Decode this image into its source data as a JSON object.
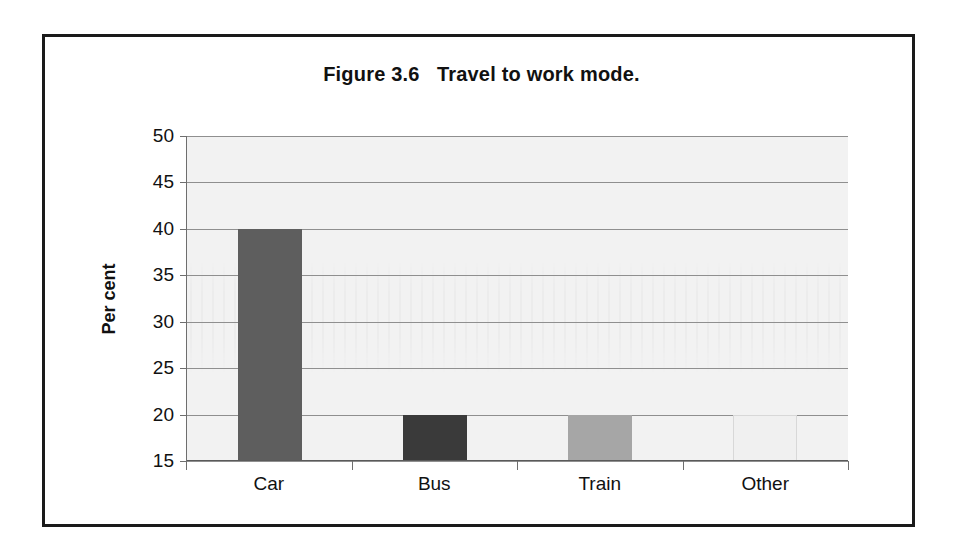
{
  "figure": {
    "title": "Figure 3.6   Travel to work mode."
  },
  "chart_data": {
    "type": "bar",
    "title": "Figure 3.6   Travel to work mode.",
    "xlabel": "",
    "ylabel": "Per cent",
    "categories": [
      "Car",
      "Bus",
      "Train",
      "Other"
    ],
    "values": [
      40,
      20,
      20,
      20
    ],
    "series": [
      {
        "name": "Travel to work mode",
        "values": [
          40,
          20,
          20,
          20
        ]
      }
    ],
    "ylim": [
      15,
      50
    ],
    "ytick_labels": [
      "50",
      "45",
      "40",
      "35",
      "30",
      "25",
      "20",
      "15"
    ],
    "ytick_values": [
      50,
      45,
      40,
      35,
      30,
      25,
      20,
      15
    ],
    "ytick_step": 5,
    "grid": true,
    "grid_axis": "y",
    "legend": false,
    "legend_position": "none",
    "bar_colors": [
      "#5e5e5e",
      "#3a3a3a",
      "#a6a6a6",
      "#f0f0f0"
    ],
    "plot_background": "#f2f2f2",
    "gridline_color": "#8f8f8f",
    "axis_color": "#5a5a5a",
    "border_color": "#1a1a1a",
    "text_color": "#111111"
  }
}
